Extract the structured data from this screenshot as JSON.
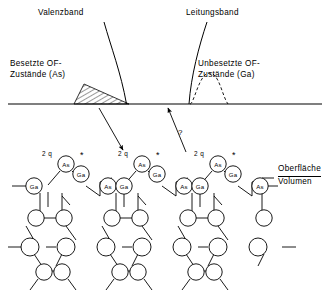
{
  "figure": {
    "title_labels": {
      "valence_band": "Valenzband",
      "conduction_band": "Leitungsband",
      "occupied_states": "Besetzte OF-\nZustände (As)",
      "unoccupied_states": "Unbesetzte OF-\nZustände (Ga)",
      "surface": "Oberfläche",
      "bulk": "Volumen",
      "question_mark": "?"
    },
    "colors": {
      "line": "#000000",
      "background": "#ffffff",
      "hatch": "#000000"
    },
    "surface_line": {
      "y": 104,
      "x_start": 8,
      "x_end": 322
    },
    "bands": [
      {
        "name": "valence-band",
        "label": "Valenzband",
        "curve": "M 104 22 C 112 48, 122 74, 127 104"
      },
      {
        "name": "conduction-band",
        "label": "Leitungsband",
        "curve": "M 207 22 C 198 48, 190 78, 188 104"
      }
    ],
    "occupied_peak": {
      "name": "occupied-surface-states",
      "shape": "hatched-triangle",
      "x_left": 76,
      "x_right": 128,
      "apex_x": 84,
      "apex_y": 84,
      "baseline_y": 104
    },
    "unoccupied_peak": {
      "name": "unoccupied-surface-states",
      "shape": "dashed-bell",
      "x_left": 190,
      "x_right": 228,
      "apex_x": 208,
      "apex_y": 72,
      "baseline_y": 104
    },
    "arrows": [
      {
        "name": "arrow-occupied-to-as",
        "from": [
          99,
          110
        ],
        "to": [
          124,
          152
        ],
        "direction": "down-right"
      },
      {
        "name": "arrow-unoccupied-from-ga",
        "from": [
          186,
          152
        ],
        "to": [
          167,
          110
        ],
        "direction": "up-left"
      }
    ]
  },
  "lattice": {
    "unit_cells": [
      {
        "charge_label": "2 q",
        "star_label": "*",
        "top_atom": "As",
        "second_atom": "Ga",
        "charge_x": 42,
        "charge_y": 150,
        "star_x": 82,
        "star_y": 154
      },
      {
        "charge_label": "2 q",
        "star_label": "*",
        "top_atom": "As",
        "second_atom": "Ga",
        "charge_x": 118,
        "charge_y": 150,
        "star_x": 158,
        "star_y": 154
      },
      {
        "charge_label": "2 q",
        "star_label": "*",
        "top_atom": "As",
        "second_atom": "Ga",
        "charge_x": 194,
        "charge_y": 150,
        "star_x": 234,
        "star_y": 154
      }
    ],
    "surface_row_atoms": [
      "As",
      "Ga",
      "As",
      "Ga",
      "As",
      "Ga"
    ],
    "second_row_atoms": [
      "Ga",
      "As",
      "Ga",
      "As",
      "Ga",
      "As"
    ],
    "bulk_rows_unlabeled": true,
    "atom_labels": {
      "arsenic": "As",
      "gallium": "Ga"
    }
  }
}
